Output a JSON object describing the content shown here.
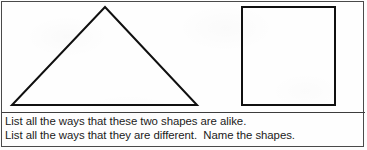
{
  "worksheet": {
    "figures": {
      "triangle": {
        "name": "triangle",
        "apex": [
          103,
          5
        ],
        "base_left": [
          10,
          103
        ],
        "base_right": [
          195,
          103
        ],
        "stroke_color": "#101010",
        "stroke_width": 2,
        "fill": "none"
      },
      "square": {
        "name": "square",
        "x": 240,
        "y": 5,
        "width": 93,
        "height": 98,
        "stroke_color": "#101010",
        "stroke_width": 2,
        "fill": "none"
      }
    },
    "prompt": {
      "line1": "List all the ways that these two shapes are alike.",
      "line2": "List all the ways that they are different.  Name the shapes."
    },
    "colors": {
      "ink": "#1b1b1b",
      "stroke": "#101010",
      "frame": "#4a4a4a",
      "paper": "#fefefe"
    }
  }
}
